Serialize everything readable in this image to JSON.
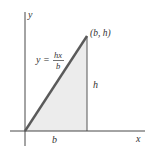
{
  "diagram": {
    "axes": {
      "x_label": "x",
      "y_label": "y"
    },
    "curve_label": {
      "lhs": "y =",
      "numerator": "hx",
      "denominator": "b"
    },
    "point_label": "(b, h)",
    "height_label": "h",
    "base_label": "b",
    "colors": {
      "line": "#555555",
      "fill": "#ececec",
      "axis": "#333333",
      "hypotenuse": "#5a5a5a"
    }
  }
}
